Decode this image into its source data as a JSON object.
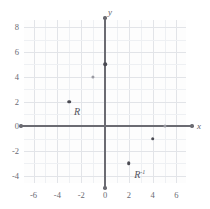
{
  "chart_data": {
    "type": "scatter",
    "title": "",
    "xlabel": "x",
    "ylabel": "y",
    "xlim": [
      -6.8,
      6.8
    ],
    "ylim": [
      -4.6,
      8.6
    ],
    "grid": true,
    "legend": false,
    "xticks": [
      "-6",
      "-4",
      "-2",
      "0",
      "2",
      "4",
      "6"
    ],
    "xtick_values": [
      -6,
      -4,
      -2,
      0,
      2,
      4,
      6
    ],
    "yticks": [
      "8",
      "6",
      "4",
      "2",
      "0",
      "-2",
      "-4"
    ],
    "ytick_values": [
      8,
      6,
      4,
      2,
      0,
      -2,
      -4
    ],
    "series": [
      {
        "name": "R",
        "label": "R",
        "label_superscript": "",
        "color": "#4a4a52",
        "points": [
          {
            "x": -3,
            "y": 2,
            "style": "dark"
          },
          {
            "x": -1,
            "y": 4,
            "style": "light"
          },
          {
            "x": 0,
            "y": 5,
            "style": "dark"
          }
        ]
      },
      {
        "name": "R-inverse",
        "label": "R",
        "label_superscript": "-1",
        "color": "#4a4a52",
        "points": [
          {
            "x": 5,
            "y": 0,
            "style": "light"
          },
          {
            "x": 4,
            "y": -1,
            "style": "dark"
          },
          {
            "x": 2,
            "y": -3,
            "style": "dark"
          }
        ]
      }
    ],
    "annotations": [
      {
        "text": "R",
        "superscript": "",
        "x": -2.6,
        "y": 1.55
      },
      {
        "text": "R",
        "superscript": "-1",
        "x": 2.45,
        "y": -3.5
      }
    ]
  },
  "axes": {
    "x_letter": "x",
    "y_letter": "y"
  }
}
